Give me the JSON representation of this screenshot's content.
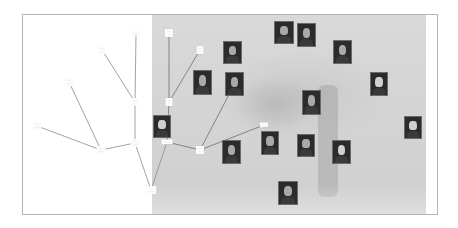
{
  "diagram": {
    "type": "family-tree",
    "colors": {
      "frame_border": "#b4b4b4",
      "left_panel": "#ffffff",
      "tree_background": "#d4d4d4",
      "connector_left": "#8a8a8a",
      "connector_right": "#6e6e6e",
      "label_bg": "#fbfbfb"
    },
    "labels": [
      {
        "id": "n1",
        "text": "······"
      },
      {
        "id": "n2",
        "text": "····\n···"
      },
      {
        "id": "n3",
        "text": "····\n······"
      },
      {
        "id": "n4",
        "text": "·····\n···"
      },
      {
        "id": "n5",
        "text": "···\n······"
      },
      {
        "id": "n6",
        "text": "····\n······"
      },
      {
        "id": "n7",
        "text": "····\n······"
      },
      {
        "id": "n8",
        "text": "···\n·······"
      },
      {
        "id": "n9",
        "text": "·····\n···"
      },
      {
        "id": "n10",
        "text": "····\n···"
      },
      {
        "id": "n11",
        "text": "····\n···"
      },
      {
        "id": "n12",
        "text": "········"
      },
      {
        "id": "n13",
        "text": "·····\n···"
      },
      {
        "id": "n14",
        "text": "·····"
      }
    ],
    "portraits": [
      {
        "id": "p1",
        "alt": "portrait-man"
      },
      {
        "id": "p2",
        "alt": "portrait-man"
      },
      {
        "id": "p3",
        "alt": "portrait-woman-hat"
      },
      {
        "id": "p4",
        "alt": "portrait-woman"
      },
      {
        "id": "p5",
        "alt": "portrait-woman"
      },
      {
        "id": "p6",
        "alt": "portrait-woman"
      },
      {
        "id": "p7",
        "alt": "portrait-man-elderly"
      },
      {
        "id": "p8",
        "alt": "portrait-man-elderly"
      },
      {
        "id": "p9",
        "alt": "portrait-man-bearded"
      },
      {
        "id": "p10",
        "alt": "portrait-man"
      },
      {
        "id": "p11",
        "alt": "portrait-man-uniform"
      },
      {
        "id": "p12",
        "alt": "portrait-woman"
      },
      {
        "id": "p13",
        "alt": "portrait-woman-elderly"
      },
      {
        "id": "p14",
        "alt": "portrait-woman-elderly"
      },
      {
        "id": "p15",
        "alt": "portrait-woman"
      }
    ],
    "connections": [
      [
        "n1",
        "n4"
      ],
      [
        "n2",
        "n4"
      ],
      [
        "n4",
        "n7"
      ],
      [
        "n3",
        "n6"
      ],
      [
        "n5",
        "n6"
      ],
      [
        "n6",
        "n7"
      ],
      [
        "n7",
        "n8"
      ],
      [
        "n9",
        "n11"
      ],
      [
        "n10",
        "n11"
      ],
      [
        "n11",
        "n12"
      ],
      [
        "n12",
        "n8"
      ],
      [
        "n12",
        "n13"
      ],
      [
        "n13",
        "n14"
      ],
      [
        "n13",
        "p6"
      ]
    ]
  }
}
